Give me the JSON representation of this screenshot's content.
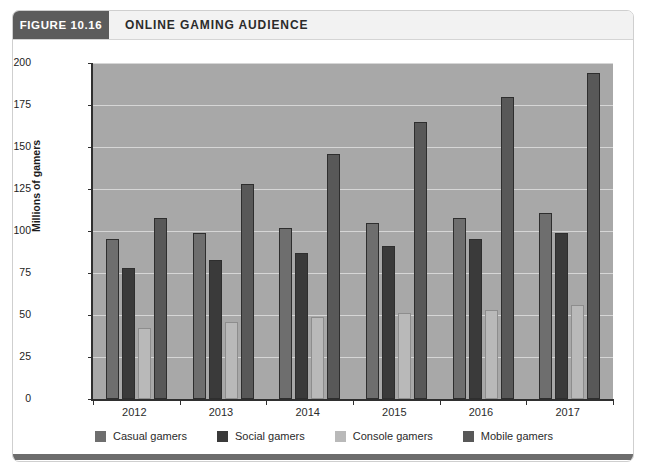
{
  "figure": {
    "badge": "FIGURE 10.16",
    "title": "ONLINE GAMING AUDIENCE"
  },
  "colors": {
    "badge_bg": "#5c5c5c",
    "plot_bg": "#a8a8a8",
    "gridline": "#dedede",
    "axis": "#2f2f2f",
    "casual": "#6e6e6e",
    "social": "#3a3a3a",
    "console": "#b9b9b9",
    "mobile": "#585858"
  },
  "chart_data": {
    "type": "bar",
    "title": "ONLINE GAMING AUDIENCE",
    "xlabel": "",
    "ylabel": "Millions of gamers",
    "categories": [
      "2012",
      "2013",
      "2014",
      "2015",
      "2016",
      "2017"
    ],
    "ylim": [
      0,
      200
    ],
    "yticks": [
      0,
      25,
      50,
      75,
      100,
      125,
      150,
      175,
      200
    ],
    "ytick_labels": [
      "0",
      "25",
      "50",
      "75",
      "100",
      "125",
      "150",
      "175",
      "200"
    ],
    "grid": true,
    "legend_position": "bottom",
    "series": [
      {
        "name": "Casual gamers",
        "color": "#6e6e6e",
        "values": [
          95,
          99,
          102,
          105,
          108,
          111
        ]
      },
      {
        "name": "Social gamers",
        "color": "#3a3a3a",
        "values": [
          78,
          83,
          87,
          91,
          95,
          99
        ]
      },
      {
        "name": "Console gamers",
        "color": "#b9b9b9",
        "values": [
          42,
          46,
          49,
          51,
          53,
          56
        ]
      },
      {
        "name": "Mobile gamers",
        "color": "#585858",
        "values": [
          108,
          128,
          146,
          165,
          180,
          194
        ]
      }
    ]
  }
}
